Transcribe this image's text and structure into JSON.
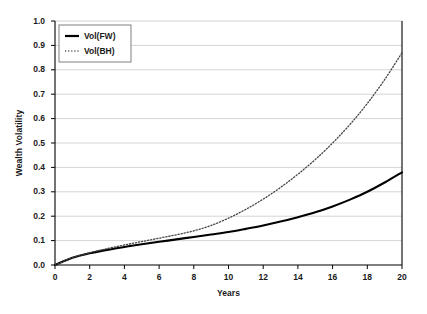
{
  "chart_data": {
    "type": "line",
    "title": "",
    "xlabel": "Years",
    "ylabel": "Wealth Volatility",
    "xlim": [
      0,
      20
    ],
    "ylim": [
      0.0,
      1.0
    ],
    "xticks": [
      "0",
      "2",
      "4",
      "6",
      "8",
      "10",
      "12",
      "14",
      "16",
      "18",
      "20"
    ],
    "yticks": [
      "0.0",
      "0.1",
      "0.2",
      "0.3",
      "0.4",
      "0.5",
      "0.6",
      "0.7",
      "0.8",
      "0.9",
      "1.0"
    ],
    "grid": "horizontal",
    "legend_position": "top-left",
    "x": [
      0,
      1,
      2,
      3,
      4,
      5,
      6,
      7,
      8,
      9,
      10,
      11,
      12,
      13,
      14,
      15,
      16,
      17,
      18,
      19,
      20
    ],
    "series": [
      {
        "name": "Vol(FW)",
        "style": "solid",
        "color": "#000000",
        "values": [
          0.0,
          0.03,
          0.048,
          0.062,
          0.074,
          0.085,
          0.095,
          0.105,
          0.115,
          0.125,
          0.135,
          0.148,
          0.162,
          0.178,
          0.196,
          0.216,
          0.24,
          0.268,
          0.3,
          0.338,
          0.38
        ]
      },
      {
        "name": "Vol(BH)",
        "style": "dotted",
        "color": "#444444",
        "values": [
          0.0,
          0.03,
          0.05,
          0.067,
          0.082,
          0.096,
          0.11,
          0.124,
          0.14,
          0.162,
          0.192,
          0.228,
          0.27,
          0.318,
          0.372,
          0.432,
          0.5,
          0.576,
          0.662,
          0.76,
          0.87
        ]
      }
    ]
  },
  "legend": {
    "items": [
      {
        "label": "Vol(FW)",
        "style": "solid"
      },
      {
        "label": "Vol(BH)",
        "style": "dotted"
      }
    ]
  }
}
